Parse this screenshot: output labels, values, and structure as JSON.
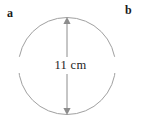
{
  "figure": {
    "background_color": "#ffffff",
    "width": 141,
    "height": 133,
    "labels": {
      "left_label": "a",
      "right_label": "b"
    },
    "shape": {
      "name": "circle",
      "stroke_color": "#a0a0a0",
      "stroke_width": 1,
      "fill": "none",
      "center_x": 67,
      "center_y": 66,
      "radius": 48.5
    },
    "dimension": {
      "measurement_text": "11 cm",
      "value": 11,
      "unit": "cm",
      "quantity": "diameter",
      "orientation": "vertical",
      "line_color": "#8c8c8c",
      "arrow_start_y": 18,
      "arrow_end_y": 114,
      "arrow_x": 67,
      "arrowheads": [
        "up",
        "down"
      ]
    }
  }
}
